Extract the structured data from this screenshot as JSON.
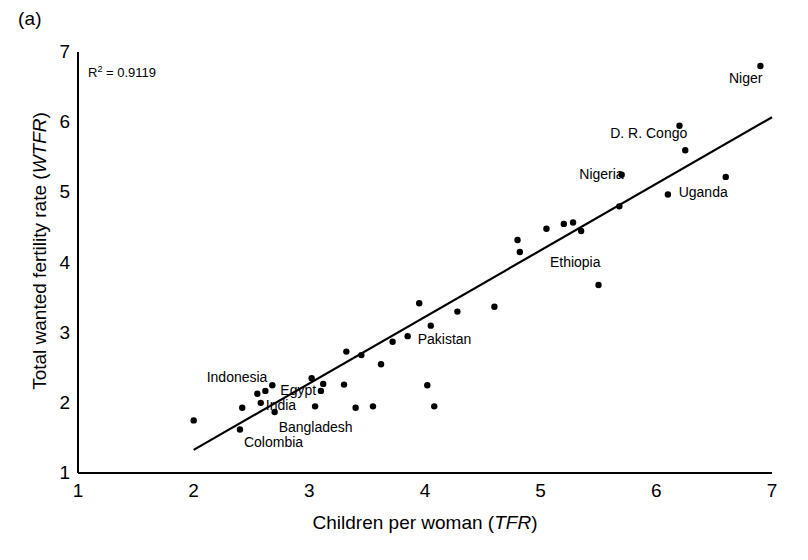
{
  "figure": {
    "panel_label": "(a)",
    "annotation": {
      "prefix": "R",
      "exponent": "2",
      "value": " = 0.9119"
    }
  },
  "chart_data": {
    "type": "scatter",
    "title": "",
    "subtitle": "",
    "xlabel": "Children per woman (TFR)",
    "xlabel_plain": "Children per woman ",
    "xlabel_italic": "TFR",
    "ylabel": "Total wanted fertility rate (WTFR)",
    "ylabel_plain": "Total wanted fertility rate ",
    "ylabel_italic": "WTFR",
    "xlim": [
      1,
      7
    ],
    "ylim": [
      1,
      7
    ],
    "xticks": [
      1,
      2,
      3,
      4,
      5,
      6,
      7
    ],
    "yticks": [
      1,
      2,
      3,
      4,
      5,
      6,
      7
    ],
    "grid": false,
    "legend": false,
    "r_squared": 0.9119,
    "marker_color": "#000000",
    "line_color": "#000000",
    "trendline": {
      "x": [
        2.0,
        7.0
      ],
      "y": [
        1.33,
        6.07
      ]
    },
    "points": [
      {
        "x": 2.0,
        "y": 1.75,
        "label": ""
      },
      {
        "x": 2.4,
        "y": 1.62,
        "label": "Colombia",
        "label_dx": 4,
        "label_dy": 14
      },
      {
        "x": 2.42,
        "y": 1.93,
        "label": ""
      },
      {
        "x": 2.55,
        "y": 2.13,
        "label": ""
      },
      {
        "x": 2.58,
        "y": 2.0,
        "label": "India",
        "label_dx": 5,
        "label_dy": 3
      },
      {
        "x": 2.62,
        "y": 2.17,
        "label": "Indonesia",
        "label_dx": -54,
        "label_dy": -13
      },
      {
        "x": 2.68,
        "y": 2.25,
        "label": "Egypt",
        "label_dx": 8,
        "label_dy": 6
      },
      {
        "x": 2.7,
        "y": 1.87,
        "label": "Bangladesh",
        "label_dx": 4,
        "label_dy": 16
      },
      {
        "x": 3.02,
        "y": 2.35,
        "label": ""
      },
      {
        "x": 3.05,
        "y": 1.95,
        "label": ""
      },
      {
        "x": 3.1,
        "y": 2.17,
        "label": ""
      },
      {
        "x": 3.12,
        "y": 2.27,
        "label": ""
      },
      {
        "x": 3.3,
        "y": 2.26,
        "label": ""
      },
      {
        "x": 3.32,
        "y": 2.73,
        "label": ""
      },
      {
        "x": 3.4,
        "y": 1.93,
        "label": ""
      },
      {
        "x": 3.45,
        "y": 2.68,
        "label": ""
      },
      {
        "x": 3.55,
        "y": 1.95,
        "label": ""
      },
      {
        "x": 3.62,
        "y": 2.55,
        "label": ""
      },
      {
        "x": 3.72,
        "y": 2.87,
        "label": ""
      },
      {
        "x": 3.85,
        "y": 2.95,
        "label": "Pakistan",
        "label_dx": 10,
        "label_dy": 4
      },
      {
        "x": 3.95,
        "y": 3.42,
        "label": ""
      },
      {
        "x": 4.02,
        "y": 2.25,
        "label": ""
      },
      {
        "x": 4.05,
        "y": 3.1,
        "label": ""
      },
      {
        "x": 4.08,
        "y": 1.95,
        "label": ""
      },
      {
        "x": 4.28,
        "y": 3.3,
        "label": ""
      },
      {
        "x": 4.6,
        "y": 3.37,
        "label": ""
      },
      {
        "x": 4.8,
        "y": 4.32,
        "label": ""
      },
      {
        "x": 4.82,
        "y": 4.15,
        "label": ""
      },
      {
        "x": 5.05,
        "y": 4.48,
        "label": ""
      },
      {
        "x": 5.2,
        "y": 4.55,
        "label": ""
      },
      {
        "x": 5.28,
        "y": 4.57,
        "label": ""
      },
      {
        "x": 5.35,
        "y": 4.45,
        "label": ""
      },
      {
        "x": 5.5,
        "y": 3.68,
        "label": "Ethiopia",
        "label_dx": -4,
        "label_dy": -22
      },
      {
        "x": 5.68,
        "y": 4.8,
        "label": ""
      },
      {
        "x": 5.7,
        "y": 5.25,
        "label": "Nigeria",
        "label_dx": -62,
        "label_dy": 0
      },
      {
        "x": 6.1,
        "y": 4.97,
        "label": ""
      },
      {
        "x": 6.2,
        "y": 5.95,
        "label": ""
      },
      {
        "x": 6.25,
        "y": 5.6,
        "label": "D. R. Congo",
        "label_dx": -10,
        "label_dy": -16
      },
      {
        "x": 6.6,
        "y": 5.22,
        "label": "Uganda",
        "label_dx": -14,
        "label_dy": 16
      },
      {
        "x": 6.9,
        "y": 6.8,
        "label": "Niger",
        "label_dx": -36,
        "label_dy": 13
      }
    ]
  }
}
